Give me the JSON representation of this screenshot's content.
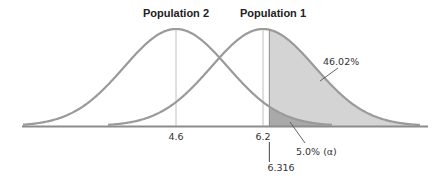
{
  "chart_data": {
    "type": "area",
    "title": "",
    "xlabel": "",
    "ylabel": "",
    "grid": false,
    "series": [
      {
        "name": "Population 2",
        "mean": 4.6,
        "distribution": "normal"
      },
      {
        "name": "Population 1",
        "mean": 6.2,
        "distribution": "normal"
      }
    ],
    "critical_value": 6.316,
    "tick_labels": [
      "4.6",
      "6.2",
      "6.316"
    ],
    "annotations": [
      {
        "text": "46.02%",
        "region": "Population 1 area right of 6.316"
      },
      {
        "text": "5.0% (α)",
        "region": "Population 2 area right of 6.316"
      }
    ],
    "colors": {
      "curve": "#9a9a9a",
      "power_fill": "#d4d4d4",
      "alpha_fill": "#a9a9a9",
      "axis": "#8c8c8c"
    }
  },
  "labels": {
    "pop2": "Population 2",
    "pop1": "Population 1",
    "tick_mean2": "4.6",
    "tick_mean1": "6.2",
    "tick_crit": "6.316",
    "power": "46.02%",
    "alpha": "5.0% (α)"
  }
}
